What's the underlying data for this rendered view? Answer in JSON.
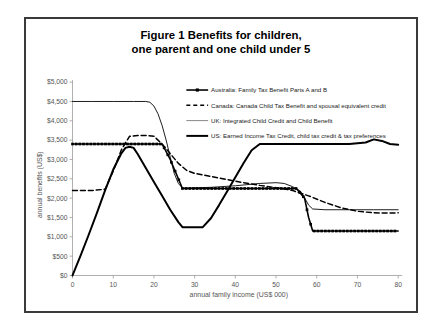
{
  "figure": {
    "title_line1": "Figure 1   Benefits for children,",
    "title_line2": "one parent and one child under 5"
  },
  "chart_data": {
    "type": "line",
    "title": "Figure 1   Benefits for children, one parent and one child under 5",
    "xlabel": "annual family income (US$ 000)",
    "ylabel": "annual benefits (US$)",
    "xlim": [
      0,
      80
    ],
    "ylim": [
      0,
      5000
    ],
    "xticks": [
      0,
      10,
      20,
      30,
      40,
      50,
      60,
      70,
      80
    ],
    "xtick_labels": [
      "0",
      "10",
      "20",
      "30",
      "40",
      "50",
      "60",
      "70",
      "80"
    ],
    "yticks": [
      0,
      500,
      1000,
      1500,
      2000,
      2500,
      3000,
      3500,
      4000,
      4500,
      5000
    ],
    "ytick_labels": [
      "$0",
      "$500",
      "$1,000",
      "$1,500",
      "$2,000",
      "$2,500",
      "$3,000",
      "$3,500",
      "$4,000",
      "$4,500",
      "$5,000"
    ],
    "grid": false,
    "legend_position": "upper right",
    "series": [
      {
        "name": "Australia: Family Tax Benefit Parts A and B",
        "style": "solid-with-square-markers",
        "color": "#000000",
        "stroke_width": 1.6,
        "marker": "square",
        "points": [
          [
            0,
            3400
          ],
          [
            5,
            3400
          ],
          [
            10,
            3400
          ],
          [
            15,
            3400
          ],
          [
            20,
            3400
          ],
          [
            22,
            3400
          ],
          [
            24,
            3000
          ],
          [
            26,
            2500
          ],
          [
            27,
            2250
          ],
          [
            28,
            2250
          ],
          [
            35,
            2250
          ],
          [
            42,
            2250
          ],
          [
            50,
            2250
          ],
          [
            55,
            2250
          ],
          [
            57,
            2000
          ],
          [
            58,
            1500
          ],
          [
            59,
            1150
          ],
          [
            62,
            1150
          ],
          [
            68,
            1150
          ],
          [
            74,
            1150
          ],
          [
            80,
            1150
          ]
        ]
      },
      {
        "name": "Canada: Canada Child Tax Benefit and spousal equivalent credit",
        "style": "dashed",
        "color": "#000000",
        "stroke_width": 1.5,
        "dash": "5,3",
        "points": [
          [
            0,
            2200
          ],
          [
            5,
            2200
          ],
          [
            8,
            2230
          ],
          [
            10,
            2700
          ],
          [
            12,
            3250
          ],
          [
            14,
            3600
          ],
          [
            16,
            3620
          ],
          [
            18,
            3620
          ],
          [
            20,
            3600
          ],
          [
            21,
            3500
          ],
          [
            22,
            3400
          ],
          [
            24,
            3150
          ],
          [
            26,
            2900
          ],
          [
            28,
            2720
          ],
          [
            30,
            2640
          ],
          [
            34,
            2560
          ],
          [
            38,
            2480
          ],
          [
            42,
            2400
          ],
          [
            46,
            2330
          ],
          [
            50,
            2270
          ],
          [
            54,
            2200
          ],
          [
            58,
            2060
          ],
          [
            62,
            1890
          ],
          [
            66,
            1750
          ],
          [
            70,
            1660
          ],
          [
            74,
            1620
          ],
          [
            78,
            1615
          ],
          [
            80,
            1620
          ]
        ]
      },
      {
        "name": "UK: Integrated Child Credit and Child Benefit",
        "style": "thin-solid",
        "color": "#7a7a7a",
        "stroke_width": 0.9,
        "points": [
          [
            0,
            4500
          ],
          [
            5,
            4500
          ],
          [
            10,
            4500
          ],
          [
            15,
            4500
          ],
          [
            18,
            4500
          ],
          [
            19,
            4480
          ],
          [
            20,
            4380
          ],
          [
            21,
            4180
          ],
          [
            22,
            3880
          ],
          [
            23,
            3500
          ],
          [
            24,
            3060
          ],
          [
            25,
            2640
          ],
          [
            26,
            2380
          ],
          [
            27,
            2260
          ],
          [
            28,
            2260
          ],
          [
            34,
            2280
          ],
          [
            40,
            2320
          ],
          [
            46,
            2380
          ],
          [
            50,
            2400
          ],
          [
            52,
            2380
          ],
          [
            54,
            2300
          ],
          [
            56,
            2180
          ],
          [
            57,
            2010
          ],
          [
            58,
            1820
          ],
          [
            59,
            1720
          ],
          [
            62,
            1700
          ],
          [
            68,
            1700
          ],
          [
            74,
            1700
          ],
          [
            80,
            1700
          ]
        ]
      },
      {
        "name": "US: Earned Income Tax Credit, child tax credit & tax preferences",
        "style": "thick-solid",
        "color": "#000000",
        "stroke_width": 2.0,
        "points": [
          [
            0,
            0
          ],
          [
            2,
            520
          ],
          [
            4,
            1060
          ],
          [
            6,
            1620
          ],
          [
            8,
            2200
          ],
          [
            10,
            2740
          ],
          [
            12,
            3160
          ],
          [
            13,
            3300
          ],
          [
            14,
            3330
          ],
          [
            15,
            3300
          ],
          [
            16,
            3140
          ],
          [
            18,
            2780
          ],
          [
            20,
            2420
          ],
          [
            22,
            2060
          ],
          [
            24,
            1700
          ],
          [
            26,
            1380
          ],
          [
            27,
            1250
          ],
          [
            28,
            1250
          ],
          [
            30,
            1250
          ],
          [
            32,
            1250
          ],
          [
            34,
            1480
          ],
          [
            36,
            1820
          ],
          [
            38,
            2180
          ],
          [
            40,
            2540
          ],
          [
            42,
            2900
          ],
          [
            44,
            3240
          ],
          [
            46,
            3400
          ],
          [
            50,
            3400
          ],
          [
            56,
            3400
          ],
          [
            62,
            3400
          ],
          [
            68,
            3400
          ],
          [
            72,
            3440
          ],
          [
            74,
            3520
          ],
          [
            76,
            3480
          ],
          [
            78,
            3400
          ],
          [
            80,
            3380
          ]
        ]
      }
    ]
  },
  "legend": {
    "items": [
      {
        "label": "Australia: Family Tax Benefit Parts A and B",
        "swatch": "solid-marker-swatch"
      },
      {
        "label": "Canada: Canada Child Tax Benefit and spousal equivalent credit",
        "swatch": "dashed-swatch"
      },
      {
        "label": "UK: Integrated Child Credit and Child Benefit",
        "swatch": "thin-line-swatch"
      },
      {
        "label": "US: Earned Income Tax Credit, child tax credit & tax preferences",
        "swatch": "thick-line-swatch"
      }
    ]
  }
}
